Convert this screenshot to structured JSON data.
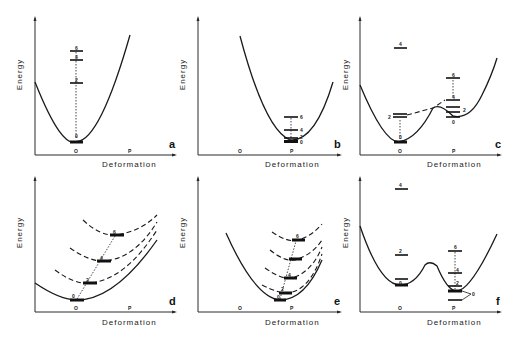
{
  "figure": {
    "panels": [
      {
        "id": "a",
        "y_label": "Energy",
        "x_label": "Deformation",
        "tick_o": "O",
        "tick_p": "P",
        "levels": [
          {
            "spin": "0"
          },
          {
            "spin": "2"
          },
          {
            "spin": "4"
          },
          {
            "spin": "6"
          }
        ]
      },
      {
        "id": "b",
        "y_label": "Energy",
        "x_label": "Deformation",
        "tick_o": "O",
        "tick_p": "P",
        "levels": [
          {
            "spin": "0"
          },
          {
            "spin": "2"
          },
          {
            "spin": "4"
          },
          {
            "spin": "6"
          }
        ]
      },
      {
        "id": "c",
        "y_label": "Energy",
        "x_label": "Deformation",
        "tick_o": "O",
        "tick_p": "P",
        "levels_o": [
          {
            "spin": "0"
          },
          {
            "spin": "2"
          },
          {
            "spin": "4"
          }
        ],
        "levels_p": [
          {
            "spin": "0"
          },
          {
            "spin": "2"
          },
          {
            "spin": "4"
          },
          {
            "spin": "6"
          }
        ]
      },
      {
        "id": "d",
        "y_label": "Energy",
        "x_label": "Deformation",
        "tick_o": "O",
        "tick_p": "P",
        "levels": [
          {
            "spin": "0"
          },
          {
            "spin": "2"
          },
          {
            "spin": "4"
          },
          {
            "spin": "6"
          }
        ]
      },
      {
        "id": "e",
        "y_label": "Energy",
        "x_label": "Deformation",
        "tick_o": "O",
        "tick_p": "P",
        "levels": [
          {
            "spin": "0"
          },
          {
            "spin": "2"
          },
          {
            "spin": "4"
          },
          {
            "spin": "6"
          }
        ]
      },
      {
        "id": "f",
        "y_label": "Energy",
        "x_label": "Deformation",
        "tick_o": "O",
        "tick_p": "P",
        "levels_o": [
          {
            "spin": "0"
          },
          {
            "spin": "2"
          },
          {
            "spin": "4"
          }
        ],
        "levels_p": [
          {
            "spin": "0"
          },
          {
            "spin": "2"
          },
          {
            "spin": "4"
          },
          {
            "spin": "6"
          }
        ]
      }
    ]
  },
  "colors": {
    "ink": "#1a1a1a",
    "background": "#ffffff"
  }
}
